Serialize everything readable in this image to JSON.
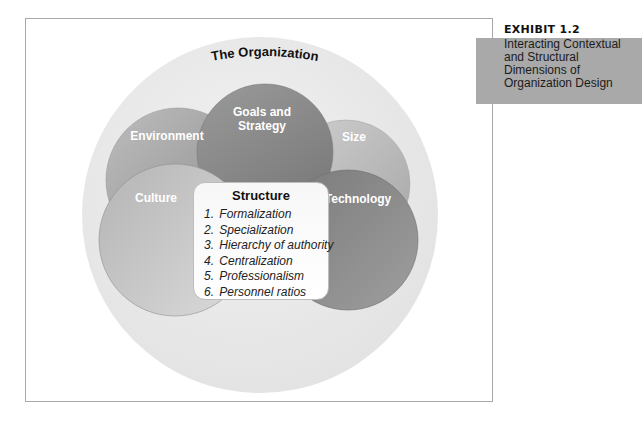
{
  "exhibit": {
    "label": "EXHIBIT 1.2",
    "title": "Interacting Contextual and Structural Dimensions of Organization Design",
    "box_color": "#a9a9a9"
  },
  "diagram": {
    "title": "The Organization",
    "outer_circle_color": "#ececec",
    "circles": [
      {
        "id": "environment",
        "label": "Environment",
        "color": "#a6a6a6"
      },
      {
        "id": "goals",
        "label_lines": [
          "Goals and",
          "Strategy"
        ],
        "color": "#8a8a8a"
      },
      {
        "id": "size",
        "label": "Size",
        "color": "#bdbdbd"
      },
      {
        "id": "culture",
        "label": "Culture",
        "color": "#9a9a9a"
      },
      {
        "id": "technology",
        "label": "Technology",
        "color": "#7e7e7e"
      }
    ],
    "structure": {
      "title": "Structure",
      "items": [
        {
          "num": "1.",
          "text": "Formalization"
        },
        {
          "num": "2.",
          "text": "Specialization"
        },
        {
          "num": "3.",
          "text": "Hierarchy of authority"
        },
        {
          "num": "4.",
          "text": "Centralization"
        },
        {
          "num": "5.",
          "text": "Professionalism"
        },
        {
          "num": "6.",
          "text": "Personnel ratios"
        }
      ]
    }
  }
}
